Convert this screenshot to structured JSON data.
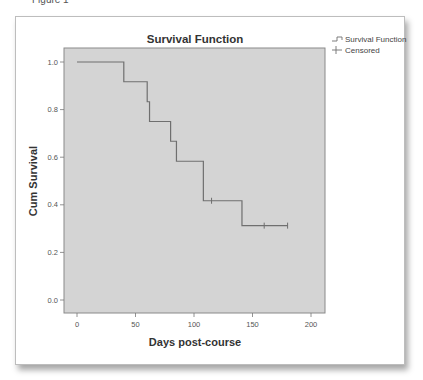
{
  "figure": {
    "top_label": "Figure 1",
    "background": "#ffffff",
    "plot_background": "#d4d4d4",
    "line_color": "#6f6f6f"
  },
  "chart_data": {
    "type": "line",
    "subtype": "kaplan-meier step",
    "title": "Survival Function",
    "xlabel": "Days post-course",
    "ylabel": "Cum Survival",
    "xlim": [
      -12,
      212
    ],
    "ylim": [
      -0.05,
      1.06
    ],
    "x_ticks": [
      0,
      50,
      100,
      150,
      200
    ],
    "y_ticks": [
      0.0,
      0.2,
      0.4,
      0.6,
      0.8,
      1.0
    ],
    "x_tick_labels": [
      "0",
      "50",
      "100",
      "150",
      "200"
    ],
    "y_tick_labels": [
      "0.0",
      "0.2",
      "0.4",
      "0.6",
      "0.8",
      "1.0"
    ],
    "grid": false,
    "legend_position": "right-outside-top",
    "legend": [
      "Survival Function",
      "Censored"
    ],
    "series": [
      {
        "name": "Survival Function",
        "step_points": [
          {
            "x": 0,
            "y": 1.0
          },
          {
            "x": 40,
            "y": 0.917
          },
          {
            "x": 60,
            "y": 0.833
          },
          {
            "x": 62,
            "y": 0.75
          },
          {
            "x": 80,
            "y": 0.667
          },
          {
            "x": 85,
            "y": 0.583
          },
          {
            "x": 108,
            "y": 0.417
          },
          {
            "x": 141,
            "y": 0.3125
          },
          {
            "x": 180,
            "y": 0.3125
          }
        ]
      },
      {
        "name": "Censored",
        "points": [
          {
            "x": 115,
            "y": 0.417
          },
          {
            "x": 160,
            "y": 0.3125
          },
          {
            "x": 180,
            "y": 0.3125
          }
        ]
      }
    ]
  }
}
